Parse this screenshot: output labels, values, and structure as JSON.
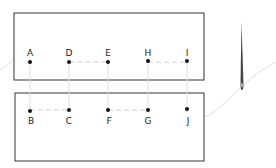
{
  "diagram": {
    "type": "ladder-stitch",
    "top_points": [
      {
        "label": "A",
        "x": 30
      },
      {
        "label": "D",
        "x": 69
      },
      {
        "label": "E",
        "x": 108
      },
      {
        "label": "H",
        "x": 148
      },
      {
        "label": "I",
        "x": 187
      }
    ],
    "bottom_points": [
      {
        "label": "B",
        "x": 30
      },
      {
        "label": "C",
        "x": 69
      },
      {
        "label": "F",
        "x": 108
      },
      {
        "label": "G",
        "x": 148
      },
      {
        "label": "J",
        "x": 187
      }
    ],
    "labels": {
      "A": "A",
      "B": "B",
      "C": "C",
      "D": "D",
      "E": "E",
      "F": "F",
      "G": "G",
      "H": "H",
      "I": "I",
      "J": "J"
    }
  }
}
